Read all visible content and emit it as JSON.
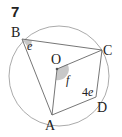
{
  "question_number": "7",
  "points": {
    "A": {
      "label": "A",
      "x": 52,
      "y": 115
    },
    "B": {
      "label": "B",
      "x": 22,
      "y": 39
    },
    "C": {
      "label": "C",
      "x": 102,
      "y": 50
    },
    "D": {
      "label": "D",
      "x": 96,
      "y": 97
    },
    "O": {
      "label": "O",
      "x": 57,
      "y": 69
    }
  },
  "circle": {
    "cx": 59,
    "cy": 76,
    "r": 50
  },
  "angles": {
    "e": {
      "label": "e",
      "at": "B"
    },
    "f": {
      "label": "f",
      "at": "O"
    },
    "four_e": {
      "label": "4e",
      "at": "D"
    }
  },
  "colors": {
    "line": "#555555",
    "circle": "#999999",
    "shade": "#c8c8c8",
    "text": "#222222"
  }
}
